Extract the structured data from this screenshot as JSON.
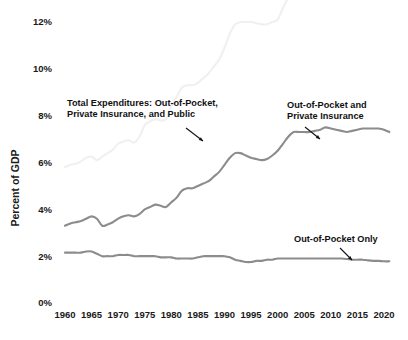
{
  "chart_data": {
    "type": "line",
    "title": "",
    "xlabel": "",
    "ylabel": "Percent of GDP",
    "xlim": [
      1960,
      2021
    ],
    "ylim": [
      0,
      12
    ],
    "grid": false,
    "legend_position": "inline-annotations",
    "ytick_labels": [
      "0%",
      "2%",
      "4%",
      "6%",
      "8%",
      "10%",
      "12%"
    ],
    "ytick_values": [
      0,
      2,
      4,
      6,
      8,
      10,
      12
    ],
    "xtick_labels": [
      "1960",
      "1965",
      "1970",
      "1975",
      "1980",
      "1985",
      "1990",
      "1995",
      "2000",
      "2005",
      "2010",
      "2015",
      "2020"
    ],
    "xtick_values": [
      1960,
      1965,
      1970,
      1975,
      1980,
      1985,
      1990,
      1995,
      2000,
      2005,
      2010,
      2015,
      2020
    ],
    "x": [
      1960,
      1961,
      1962,
      1963,
      1964,
      1965,
      1966,
      1967,
      1968,
      1969,
      1970,
      1971,
      1972,
      1973,
      1974,
      1975,
      1976,
      1977,
      1978,
      1979,
      1980,
      1981,
      1982,
      1983,
      1984,
      1985,
      1986,
      1987,
      1988,
      1989,
      1990,
      1991,
      1992,
      1993,
      1994,
      1995,
      1996,
      1997,
      1998,
      1999,
      2000,
      2001,
      2002,
      2003,
      2004,
      2005,
      2006,
      2007,
      2008,
      2009,
      2010,
      2011,
      2012,
      2013,
      2014,
      2015,
      2016,
      2017,
      2018,
      2019,
      2020,
      2021
    ],
    "series": [
      {
        "name": "Total Expenditures: Out-of-Pocket, Private Insurance, and Public",
        "color": "#f0f0f0",
        "values": [
          5.8,
          5.9,
          5.95,
          6.05,
          6.2,
          6.25,
          6.1,
          6.25,
          6.4,
          6.55,
          6.8,
          6.9,
          6.95,
          6.85,
          7.1,
          7.6,
          7.75,
          7.85,
          7.8,
          7.85,
          8.4,
          8.8,
          9.2,
          9.3,
          9.3,
          9.4,
          9.6,
          9.8,
          10.1,
          10.4,
          10.9,
          11.5,
          11.9,
          12.0,
          12.0,
          12.0,
          11.95,
          11.9,
          11.9,
          12.0,
          12.1,
          12.6,
          13.2,
          13.5,
          13.6,
          13.7,
          13.7,
          13.9,
          14.3,
          15.2,
          15.2,
          15.2,
          15.2,
          15.2,
          15.4,
          15.6,
          15.8,
          15.8,
          15.9,
          16.1,
          17.0,
          16.4
        ]
      },
      {
        "name": "Out-of-Pocket and Private Insurance",
        "color": "#8c8c8c",
        "values": [
          3.3,
          3.4,
          3.45,
          3.5,
          3.6,
          3.7,
          3.6,
          3.3,
          3.35,
          3.45,
          3.6,
          3.7,
          3.75,
          3.7,
          3.8,
          4.0,
          4.1,
          4.2,
          4.15,
          4.1,
          4.3,
          4.5,
          4.8,
          4.9,
          4.9,
          5.0,
          5.1,
          5.2,
          5.4,
          5.6,
          5.9,
          6.2,
          6.4,
          6.4,
          6.3,
          6.2,
          6.15,
          6.1,
          6.15,
          6.3,
          6.5,
          6.8,
          7.1,
          7.3,
          7.3,
          7.3,
          7.3,
          7.35,
          7.4,
          7.5,
          7.45,
          7.4,
          7.35,
          7.3,
          7.35,
          7.4,
          7.45,
          7.45,
          7.45,
          7.45,
          7.4,
          7.3
        ]
      },
      {
        "name": "Out-of-Pocket Only",
        "color": "#8c8c8c",
        "values": [
          2.15,
          2.15,
          2.15,
          2.15,
          2.2,
          2.2,
          2.1,
          2.0,
          2.0,
          2.0,
          2.05,
          2.05,
          2.05,
          2.0,
          2.0,
          2.0,
          2.0,
          2.0,
          1.95,
          1.95,
          1.95,
          1.9,
          1.9,
          1.9,
          1.9,
          1.95,
          2.0,
          2.0,
          2.0,
          2.0,
          2.0,
          1.95,
          1.85,
          1.8,
          1.75,
          1.75,
          1.8,
          1.8,
          1.85,
          1.85,
          1.9,
          1.9,
          1.9,
          1.9,
          1.9,
          1.9,
          1.9,
          1.9,
          1.9,
          1.9,
          1.9,
          1.9,
          1.9,
          1.88,
          1.85,
          1.85,
          1.85,
          1.82,
          1.8,
          1.8,
          1.78,
          1.78
        ]
      }
    ],
    "annotations": [
      {
        "name": "total-expenditures",
        "line1": "Total Expenditures: Out-of-Pocket,",
        "line2": "Private Insurance, and Public",
        "text_x": 67,
        "text_y": 106,
        "arrow": {
          "x1": 186,
          "y1": 128,
          "x2": 203,
          "y2": 141
        }
      },
      {
        "name": "out-of-pocket-and-private-insurance",
        "line1": "Out-of-Pocket and",
        "line2": "Private Insurance",
        "text_x": 287,
        "text_y": 108,
        "arrow": {
          "x1": 305,
          "y1": 127,
          "x2": 320,
          "y2": 139
        }
      },
      {
        "name": "out-of-pocket-only",
        "line1": "Out-of-Pocket Only",
        "line2": "",
        "text_x": 294,
        "text_y": 242,
        "arrow": {
          "x1": 340,
          "y1": 248,
          "x2": 352,
          "y2": 260
        }
      }
    ]
  },
  "axis": {
    "y_title": "Percent of GDP"
  },
  "colors": {
    "background": "#ffffff",
    "text": "#1a1a1a",
    "series_light": "#f0f0f0",
    "series_gray": "#8c8c8c",
    "arrow": "#111111"
  }
}
